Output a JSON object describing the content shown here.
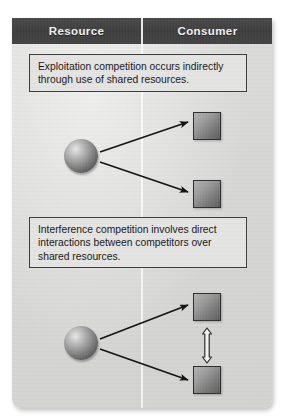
{
  "figure": {
    "header": {
      "columns": [
        {
          "label": "Resource",
          "name": "resource"
        },
        {
          "label": "Consumer",
          "name": "consumer"
        }
      ]
    },
    "panels": [
      {
        "id": "exploitation",
        "caption_lines": [
          "Exploitation competition occurs indirectly",
          "through use of shared resources."
        ],
        "caption_text": "Exploitation competition occurs indirectly through use of shared resources.",
        "resource_count": 1,
        "consumer_count": 2,
        "arrows": [
          {
            "type": "solid-arrow",
            "from": "resource-sphere",
            "to": "consumer-square-top"
          },
          {
            "type": "solid-arrow",
            "from": "resource-sphere",
            "to": "consumer-square-bottom"
          }
        ],
        "interaction_arrow": false
      },
      {
        "id": "interference",
        "caption_lines": [
          "Interference competition involves direct",
          "interactions between competitors over",
          "shared resources."
        ],
        "caption_text": "Interference competition involves direct interactions between competitors over shared resources.",
        "resource_count": 1,
        "consumer_count": 2,
        "arrows": [
          {
            "type": "solid-arrow",
            "from": "resource-sphere",
            "to": "consumer-square-top"
          },
          {
            "type": "solid-arrow",
            "from": "resource-sphere",
            "to": "consumer-square-bottom"
          }
        ],
        "interaction_arrow": true,
        "interaction_arrow_type": "hollow-double-headed-vertical"
      }
    ],
    "colors": {
      "header_bar": "#424242",
      "header_text": "#f2f2f2",
      "panel_background": "#d8d8d6",
      "caption_background": "#e4e4e2",
      "caption_border": "#3c3c3c",
      "caption_text": "#161616",
      "arrow": "#111111",
      "sphere_dark": "#4a4a4a",
      "sphere_light": "#e8e8e8",
      "square_light": "#b4b4b4",
      "square_dark": "#5e5e5e"
    }
  }
}
